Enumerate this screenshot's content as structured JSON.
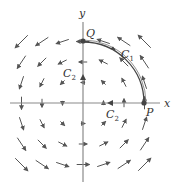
{
  "diagram": {
    "field": "F = (-y, x)",
    "grid_range": [
      -3,
      3
    ],
    "axis_labels": {
      "x": "x",
      "y": "y"
    },
    "points": [
      {
        "name": "P",
        "label": "P",
        "coords": [
          3,
          0
        ]
      },
      {
        "name": "Q",
        "label": "Q",
        "coords": [
          0,
          3
        ]
      }
    ],
    "curves": [
      {
        "name": "C1",
        "label": "C",
        "sub": "1",
        "description": "quarter circle arc from P to Q, counterclockwise"
      },
      {
        "name": "C2",
        "label": "C",
        "sub": "2",
        "description": "straight segments from P to origin along x-axis, then origin to Q along y-axis"
      }
    ],
    "colors": {
      "axis": "#888888",
      "arrow": "#555555",
      "curve": "#444444",
      "point": "#444444"
    }
  }
}
